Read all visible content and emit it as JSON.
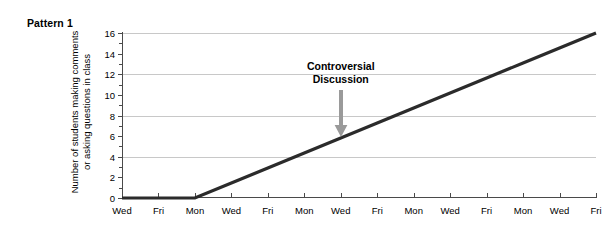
{
  "figure": {
    "pattern_label": "Pattern 1"
  },
  "chart_data": {
    "type": "line",
    "title": "Pattern 1",
    "xlabel": "",
    "ylabel": "Number of students making comments or asking questions in class",
    "ylabel_lines": [
      "Number of students making comments",
      "or asking questions in class"
    ],
    "categories": [
      "Wed",
      "Fri",
      "Mon",
      "Wed",
      "Fri",
      "Mon",
      "Wed",
      "Fri",
      "Mon",
      "Wed",
      "Fri",
      "Mon",
      "Wed",
      "Fri"
    ],
    "values": [
      0,
      0,
      0,
      1.45,
      2.91,
      4.36,
      5.82,
      7.27,
      8.73,
      10.18,
      11.64,
      13.09,
      14.55,
      16
    ],
    "series": [
      {
        "name": "Students participating",
        "values": [
          0,
          0,
          0,
          1.45,
          2.91,
          4.36,
          5.82,
          7.27,
          8.73,
          10.18,
          11.64,
          13.09,
          14.55,
          16
        ]
      }
    ],
    "ylim": [
      0,
      16
    ],
    "yticks": [
      0,
      2,
      4,
      6,
      8,
      10,
      12,
      14,
      16
    ],
    "ytick_labels": [
      "0",
      "2",
      "4",
      "6",
      "8",
      "10",
      "12",
      "14",
      "16"
    ],
    "gridlines_y": [
      4,
      8,
      12,
      16
    ],
    "grid": true,
    "legend": null,
    "line_color": "#2b2b2b",
    "grid_color": "#c8c8c8",
    "axis_color": "#4a4a4a",
    "annotations": [
      {
        "text_lines": [
          "Controversial",
          "Discussion"
        ],
        "text": "Controversial Discussion",
        "x_category": "Wed",
        "x_index": 6,
        "y_target": 5.82,
        "arrow": "down-arrow",
        "arrow_color": "#9a9a9a"
      }
    ]
  }
}
